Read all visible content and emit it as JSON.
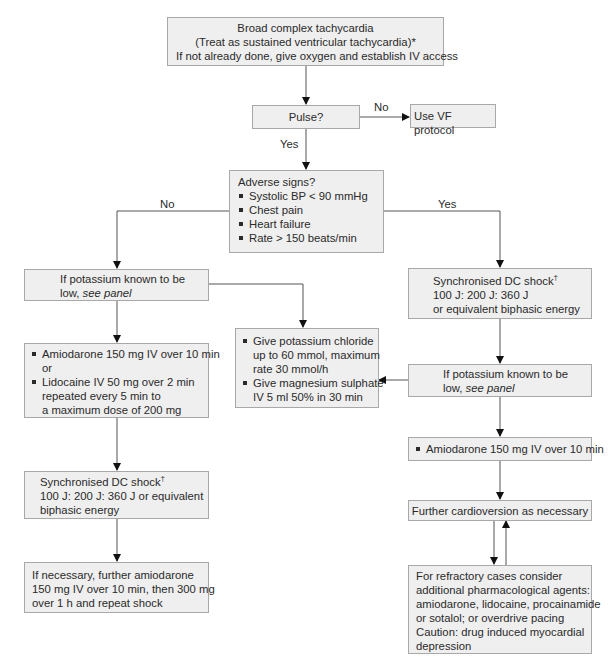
{
  "diagram": {
    "title": "Broad complex tachycardia",
    "start": {
      "lines": [
        "Broad complex tachycardia",
        "(Treat as sustained ventricular tachycardia)*",
        "If not already done, give oxygen and establish IV access"
      ]
    },
    "pulse": {
      "label": "Pulse?",
      "no_label": "No",
      "yes_label": "Yes"
    },
    "vf_protocol": {
      "label": "Use VF protocol"
    },
    "adverse_signs": {
      "heading": "Adverse signs?",
      "items": [
        "Systolic BP < 90 mmHg",
        "Chest pain",
        "Heart failure",
        "Rate > 150 beats/min"
      ],
      "no_label": "No",
      "yes_label": "Yes"
    },
    "left_branch": {
      "potassium": {
        "line1": "If potassium known to be",
        "line2_prefix": "low, ",
        "line2_link": "see panel"
      },
      "drugs": {
        "item1": "Amiodarone 150 mg IV over 10 min",
        "or": "or",
        "item2_line1": "Lidocaine IV 50 mg over 2 min",
        "item2_line2": "repeated every 5 min to",
        "item2_line3": "a maximum dose of 200 mg"
      },
      "dc_shock": {
        "line1": "Synchronised DC shock",
        "dagger": "†",
        "line2": "100 J: 200 J: 360 J or equivalent",
        "line3": "biphasic energy"
      },
      "further": {
        "line1": "If necessary, further amiodarone",
        "line2": "150 mg IV over 10 min, then 300 mg",
        "line3": "over 1 h and repeat shock"
      }
    },
    "potassium_panel": {
      "item1_line1": "Give potassium chloride",
      "item1_line2": "up to 60 mmol, maximum",
      "item1_line3": "rate 30 mmol/h",
      "item2_line1": "Give magnesium sulphate",
      "item2_line2": "IV 5 ml 50% in 30 min"
    },
    "right_branch": {
      "dc_shock": {
        "line1": "Synchronised DC shock",
        "dagger": "†",
        "line2": "100 J: 200 J: 360 J",
        "line3": "or equivalent biphasic energy"
      },
      "potassium": {
        "line1": "If potassium known to be",
        "line2_prefix": "low, ",
        "line2_link": "see panel"
      },
      "amiodarone": {
        "item": "Amiodarone 150 mg IV over 10 min"
      },
      "cardioversion": {
        "label": "Further cardioversion as necessary"
      },
      "refractory": {
        "lines": [
          "For refractory cases consider",
          "additional pharmacological agents:",
          "amiodarone, lidocaine, procainamide",
          "or sotalol; or overdrive pacing",
          "Caution: drug induced myocardial",
          "depression"
        ]
      }
    },
    "colors": {
      "box_fill": "#efefef",
      "box_border": "#a8a8a8",
      "connector": "#555555",
      "arrowhead": "#111111",
      "text": "#2a2a2a"
    }
  }
}
